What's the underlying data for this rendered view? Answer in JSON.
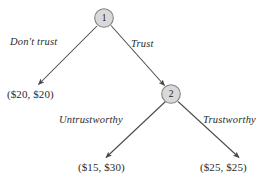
{
  "diagram": {
    "type": "extensive-form-game-tree",
    "title": "",
    "background_color": "#ffffff",
    "line_color": "#4a4a4a",
    "text_color": "#2b2b2b",
    "node_fill_color": "#d9d9d9",
    "node_stroke_color": "#808080",
    "nodes": [
      {
        "id": "1",
        "label": "1",
        "cx": 104,
        "cy": 18,
        "r": 9.5,
        "player": "Player 1"
      },
      {
        "id": "2",
        "label": "2",
        "cx": 171,
        "cy": 94,
        "r": 9.5,
        "player": "Player 2"
      }
    ],
    "edges": [
      {
        "id": "edge-dont-trust",
        "from": "1",
        "to": "payoff-20-20",
        "label": "Don't trust",
        "x1": 97,
        "y1": 26,
        "x2": 38,
        "y2": 85
      },
      {
        "id": "edge-trust",
        "from": "1",
        "to": "2",
        "label": "Trust",
        "x1": 111,
        "y1": 26,
        "x2": 165,
        "y2": 86
      },
      {
        "id": "edge-untrustworthy",
        "from": "2",
        "to": "payoff-15-30",
        "label": "Untrustworthy",
        "x1": 165,
        "y1": 102,
        "x2": 106,
        "y2": 158
      },
      {
        "id": "edge-trustworthy",
        "from": "2",
        "to": "payoff-25-25",
        "label": "Trustworthy",
        "x1": 178,
        "y1": 102,
        "x2": 239,
        "y2": 158
      }
    ],
    "edge_labels": [
      {
        "id": "label-dont-trust",
        "text": "Don't trust",
        "x": 10,
        "y": 36
      },
      {
        "id": "label-trust",
        "text": "Trust",
        "x": 131,
        "y": 38
      },
      {
        "id": "label-untrustworthy",
        "text": "Untrustworthy",
        "x": 59,
        "y": 114
      },
      {
        "id": "label-trustworthy",
        "text": "Trustworthy",
        "x": 203,
        "y": 114
      }
    ],
    "payoffs": [
      {
        "id": "payoff-20-20",
        "text": "($20, $20)",
        "player1": "$20",
        "player2": "$20",
        "x": 7,
        "y": 88
      },
      {
        "id": "payoff-15-30",
        "text": "($15, $30)",
        "player1": "$15",
        "player2": "$30",
        "x": 78,
        "y": 161
      },
      {
        "id": "payoff-25-25",
        "text": "($25, $25)",
        "player1": "$25",
        "player2": "$25",
        "x": 200,
        "y": 161
      }
    ]
  }
}
